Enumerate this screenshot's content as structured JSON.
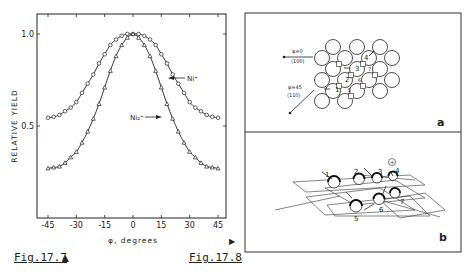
{
  "figures": {
    "left_caption": "Fig.17.7",
    "left_caption_marker": "▲",
    "right_caption": "Fig.17.8",
    "right_caption_marker": "▶"
  },
  "chart_data": {
    "type": "line",
    "title": "",
    "xlabel": "φ, degrees",
    "ylabel": "RELATIVE YIELD",
    "xlim": [
      -45,
      45
    ],
    "ylim": [
      0,
      1.0
    ],
    "x_ticks": [
      "-45",
      "-30",
      "-15",
      "0",
      "15",
      "30",
      "45"
    ],
    "y_ticks": [
      "0.5",
      "1.0"
    ],
    "grid": false,
    "x": [
      -45,
      -42,
      -39,
      -36,
      -33,
      -30,
      -27,
      -24,
      -21,
      -18,
      -15,
      -12,
      -9,
      -6,
      -3,
      0,
      3,
      6,
      9,
      12,
      15,
      18,
      21,
      24,
      27,
      30,
      33,
      36,
      39,
      42,
      45
    ],
    "series": [
      {
        "name": "Ni+",
        "label": "Ni⁺",
        "marker": "circle",
        "values": [
          0.545,
          0.55,
          0.56,
          0.58,
          0.6,
          0.63,
          0.68,
          0.73,
          0.78,
          0.84,
          0.89,
          0.94,
          0.97,
          0.99,
          1.0,
          1.0,
          1.0,
          0.99,
          0.97,
          0.94,
          0.89,
          0.84,
          0.78,
          0.73,
          0.68,
          0.63,
          0.6,
          0.58,
          0.56,
          0.55,
          0.545
        ]
      },
      {
        "name": "Ni2+",
        "label": "Ni₂⁺",
        "marker": "triangle",
        "values": [
          0.27,
          0.275,
          0.28,
          0.3,
          0.33,
          0.36,
          0.41,
          0.47,
          0.54,
          0.62,
          0.71,
          0.8,
          0.88,
          0.94,
          0.98,
          1.0,
          0.98,
          0.94,
          0.88,
          0.8,
          0.71,
          0.62,
          0.54,
          0.47,
          0.41,
          0.36,
          0.33,
          0.3,
          0.28,
          0.275,
          0.27
        ]
      }
    ],
    "annotations": [
      "Ni⁺",
      "Ni₂⁺"
    ]
  },
  "diagram": {
    "panel_a": {
      "label": "a",
      "arrow_1_top": "φ=0",
      "arrow_1_bottom": "⟨100⟩",
      "arrow_2_top": "φ=45",
      "arrow_2_bottom": "⟨110⟩",
      "atom_numbers": [
        "1",
        "2",
        "3",
        "4",
        "5",
        "6",
        "7"
      ]
    },
    "panel_b": {
      "label": "b",
      "atom_numbers": [
        "1",
        "2",
        "3",
        "4",
        "5",
        "6",
        "7"
      ],
      "ion_symbol": "+"
    }
  }
}
